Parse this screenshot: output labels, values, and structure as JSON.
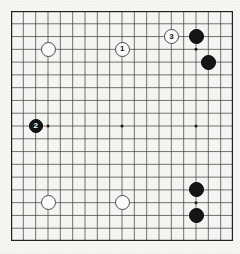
{
  "board": {
    "name": "go-board",
    "size": 19,
    "left": 11,
    "top": 11,
    "width": 222,
    "height": 230,
    "line_color": "#3a3a3a",
    "board_color": "#f4f4f2",
    "border_color": "#222222",
    "star_points": [
      {
        "col": 4,
        "row": 4
      },
      {
        "col": 10,
        "row": 4
      },
      {
        "col": 16,
        "row": 4
      },
      {
        "col": 4,
        "row": 10
      },
      {
        "col": 10,
        "row": 10
      },
      {
        "col": 16,
        "row": 10
      },
      {
        "col": 4,
        "row": 16
      },
      {
        "col": 10,
        "row": 16
      },
      {
        "col": 16,
        "row": 16
      }
    ]
  },
  "stones": [
    {
      "id": "white-upper-left",
      "color": "white",
      "col": 4,
      "row": 4,
      "label": "",
      "radius": 7.5
    },
    {
      "id": "move-1-white",
      "color": "white",
      "col": 10,
      "row": 4,
      "label": "1",
      "radius": 7.5
    },
    {
      "id": "move-3-white",
      "color": "white",
      "col": 14,
      "row": 3,
      "label": "3",
      "radius": 7.5
    },
    {
      "id": "black-upper-right-a",
      "color": "black",
      "col": 16,
      "row": 3,
      "label": "",
      "radius": 7.5
    },
    {
      "id": "black-upper-right-b",
      "color": "black",
      "col": 17,
      "row": 5,
      "label": "",
      "radius": 7.5
    },
    {
      "id": "move-2-black",
      "color": "black",
      "col": 3,
      "row": 10,
      "label": "2",
      "radius": 7.0
    },
    {
      "id": "white-lower-left",
      "color": "white",
      "col": 4,
      "row": 16,
      "label": "",
      "radius": 7.5
    },
    {
      "id": "white-lower-mid",
      "color": "white",
      "col": 10,
      "row": 16,
      "label": "",
      "radius": 7.5
    },
    {
      "id": "black-lower-right-a",
      "color": "black",
      "col": 16,
      "row": 15,
      "label": "",
      "radius": 7.5
    },
    {
      "id": "black-lower-right-b",
      "color": "black",
      "col": 16,
      "row": 17,
      "label": "",
      "radius": 7.5
    }
  ],
  "labels": {
    "move_1": "1",
    "move_2": "2",
    "move_3": "3"
  },
  "colors": {
    "black_stone": "#151515",
    "white_stone": "#fbfbfb",
    "grid_line": "#3a3a3a",
    "paper": "#f6f6f4"
  }
}
